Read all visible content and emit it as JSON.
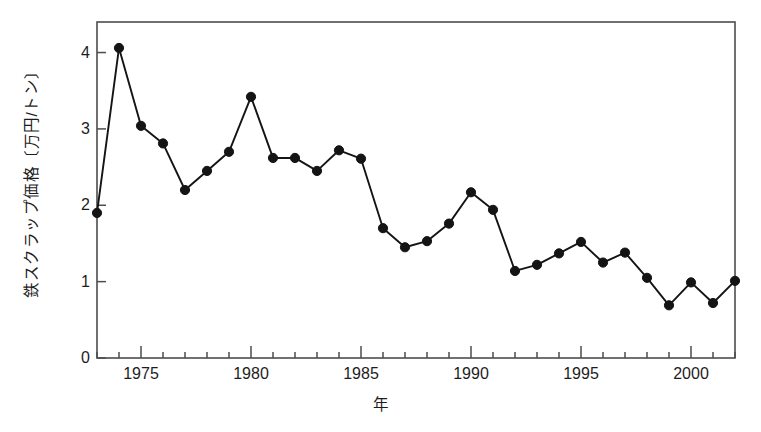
{
  "chart_data": {
    "type": "line",
    "title": "",
    "xlabel": "年",
    "ylabel": "鉄スクラップ価格〔万円/トン〕",
    "x": [
      1973,
      1974,
      1975,
      1976,
      1977,
      1978,
      1979,
      1980,
      1981,
      1982,
      1983,
      1984,
      1985,
      1986,
      1987,
      1988,
      1989,
      1990,
      1991,
      1992,
      1993,
      1994,
      1995,
      1996,
      1997,
      1998,
      1999,
      2000,
      2001,
      2002
    ],
    "values": [
      1.9,
      4.06,
      3.04,
      2.81,
      2.2,
      2.45,
      2.7,
      3.42,
      2.62,
      2.62,
      2.45,
      2.72,
      2.61,
      1.7,
      1.45,
      1.53,
      1.76,
      2.17,
      1.94,
      1.14,
      1.22,
      1.37,
      1.52,
      1.25,
      1.38,
      1.05,
      0.69,
      0.99,
      0.72,
      1.01
    ],
    "series": [
      {
        "name": "鉄スクラップ価格",
        "values": [
          1.9,
          4.06,
          3.04,
          2.81,
          2.2,
          2.45,
          2.7,
          3.42,
          2.62,
          2.62,
          2.45,
          2.72,
          2.61,
          1.7,
          1.45,
          1.53,
          1.76,
          2.17,
          1.94,
          1.14,
          1.22,
          1.37,
          1.52,
          1.25,
          1.38,
          1.05,
          0.69,
          0.99,
          0.72,
          1.01
        ]
      }
    ],
    "xlim": [
      1973,
      2002
    ],
    "ylim": [
      0,
      4.4
    ],
    "yticks": [
      0,
      1,
      2,
      3,
      4
    ],
    "ytick_labels": [
      "0",
      "1",
      "2",
      "3",
      "4"
    ],
    "xticks": [
      1975,
      1980,
      1985,
      1990,
      1995,
      2000
    ],
    "xtick_labels": [
      "1975",
      "1980",
      "1985",
      "1990",
      "1995",
      "2000"
    ],
    "x_minor_tick_interval": 1,
    "grid": false,
    "legend": null,
    "marker": "filled-circle",
    "line_color": "#141414",
    "marker_color": "#141414",
    "frame_color": "#4d4d4d",
    "background_color": "#ffffff"
  },
  "axis": {
    "y_title": "鉄スクラップ価格〔万円/トン〕",
    "x_title": "年"
  }
}
